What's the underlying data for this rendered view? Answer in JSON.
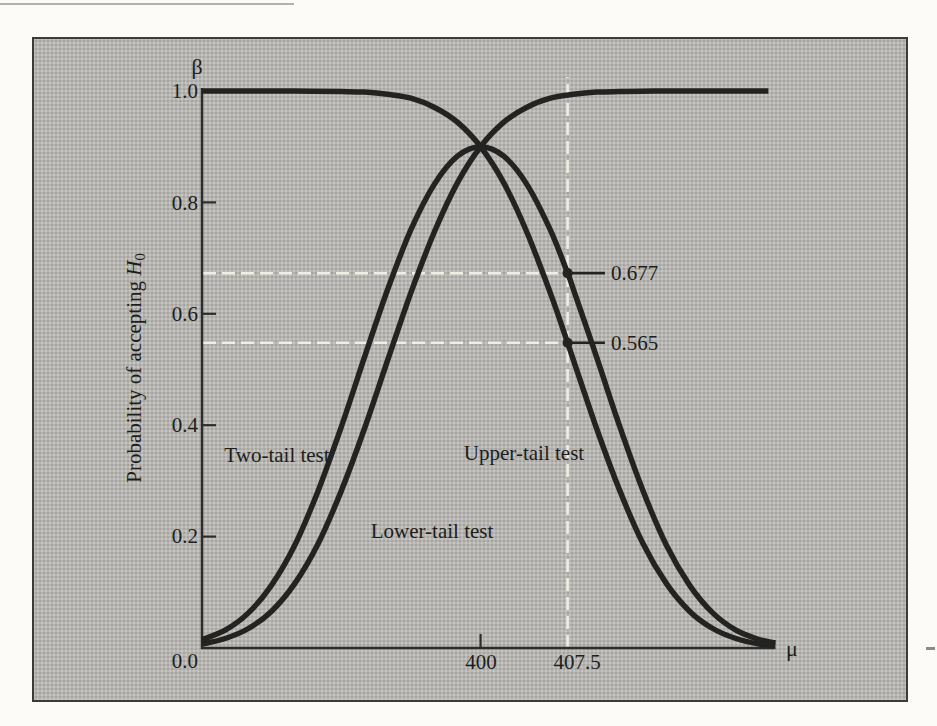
{
  "chart_data": {
    "type": "line",
    "x_axis": {
      "symbol": "μ",
      "range": [
        376,
        425.4
      ],
      "ticks": [
        {
          "label": "400",
          "value": 400,
          "mark": true
        },
        {
          "label": "407.5",
          "value": 407.5,
          "mark": false
        }
      ]
    },
    "y_axis": {
      "symbol": "β",
      "label_prefix": "Probability of accepting ",
      "label_h": "H",
      "label_sub": "0",
      "range": [
        0,
        1
      ],
      "ticks": [
        {
          "label": "1.0",
          "value": 1.0,
          "mark": false
        },
        {
          "label": "0.8",
          "value": 0.8,
          "mark": true
        },
        {
          "label": "0.6",
          "value": 0.6,
          "mark": true
        },
        {
          "label": "0.4",
          "value": 0.4,
          "mark": true
        },
        {
          "label": "0.2",
          "value": 0.2,
          "mark": true
        },
        {
          "label": "0.0",
          "value": 0.0,
          "mark": false
        }
      ]
    },
    "series": [
      {
        "name": "Two-tail test",
        "points": [
          [
            376,
            0.015
          ],
          [
            378,
            0.032
          ],
          [
            380,
            0.063
          ],
          [
            382,
            0.113
          ],
          [
            384,
            0.185
          ],
          [
            386,
            0.282
          ],
          [
            388,
            0.397
          ],
          [
            390,
            0.522
          ],
          [
            392,
            0.644
          ],
          [
            394,
            0.751
          ],
          [
            396,
            0.832
          ],
          [
            398,
            0.883
          ],
          [
            400,
            0.9
          ],
          [
            402,
            0.883
          ],
          [
            404,
            0.832
          ],
          [
            406,
            0.751
          ],
          [
            407.5,
            0.673
          ],
          [
            408,
            0.644
          ],
          [
            410,
            0.522
          ],
          [
            412,
            0.397
          ],
          [
            414,
            0.282
          ],
          [
            416,
            0.185
          ],
          [
            418,
            0.113
          ],
          [
            420,
            0.063
          ],
          [
            422,
            0.032
          ],
          [
            424,
            0.015
          ],
          [
            425.4,
            0.009
          ]
        ]
      },
      {
        "name": "Lower-tail test",
        "points": [
          [
            376,
            0.007
          ],
          [
            378,
            0.017
          ],
          [
            380,
            0.035
          ],
          [
            382,
            0.066
          ],
          [
            384,
            0.116
          ],
          [
            386,
            0.187
          ],
          [
            388,
            0.282
          ],
          [
            390,
            0.394
          ],
          [
            392,
            0.517
          ],
          [
            394,
            0.638
          ],
          [
            396,
            0.746
          ],
          [
            398,
            0.835
          ],
          [
            400,
            0.9
          ],
          [
            402,
            0.944
          ],
          [
            404,
            0.971
          ],
          [
            406,
            0.987
          ],
          [
            408,
            0.994
          ],
          [
            410,
            0.998
          ],
          [
            412,
            0.999
          ],
          [
            415,
            1.0
          ],
          [
            419,
            1.0
          ],
          [
            424.8,
            1.0
          ]
        ]
      },
      {
        "name": "Upper-tail test",
        "points": [
          [
            376,
            1.0
          ],
          [
            380,
            1.0
          ],
          [
            384,
            1.0
          ],
          [
            388,
            0.999
          ],
          [
            390,
            0.998
          ],
          [
            392,
            0.994
          ],
          [
            394,
            0.987
          ],
          [
            396,
            0.971
          ],
          [
            398,
            0.944
          ],
          [
            400,
            0.9
          ],
          [
            402,
            0.835
          ],
          [
            404,
            0.746
          ],
          [
            406,
            0.638
          ],
          [
            407.5,
            0.548
          ],
          [
            410,
            0.394
          ],
          [
            412,
            0.282
          ],
          [
            414,
            0.187
          ],
          [
            416,
            0.116
          ],
          [
            418,
            0.066
          ],
          [
            420,
            0.035
          ],
          [
            422,
            0.017
          ],
          [
            424,
            0.007
          ],
          [
            425.4,
            0.004
          ]
        ]
      }
    ],
    "annotations": [
      {
        "label": "0.677",
        "mu": 407.5,
        "series_index": 0
      },
      {
        "label": "0.565",
        "mu": 407.5,
        "series_index": 2
      }
    ],
    "guides": {
      "vertical_mu": 407.5,
      "vertical_top_beta": 1.025,
      "color": "#f1eee4"
    },
    "colors": {
      "curve": "#232321",
      "axis": "#2c2c2a",
      "background": "#b6b5b1",
      "frame_border": "#3b3b39",
      "page": "#fcfbf8"
    }
  }
}
